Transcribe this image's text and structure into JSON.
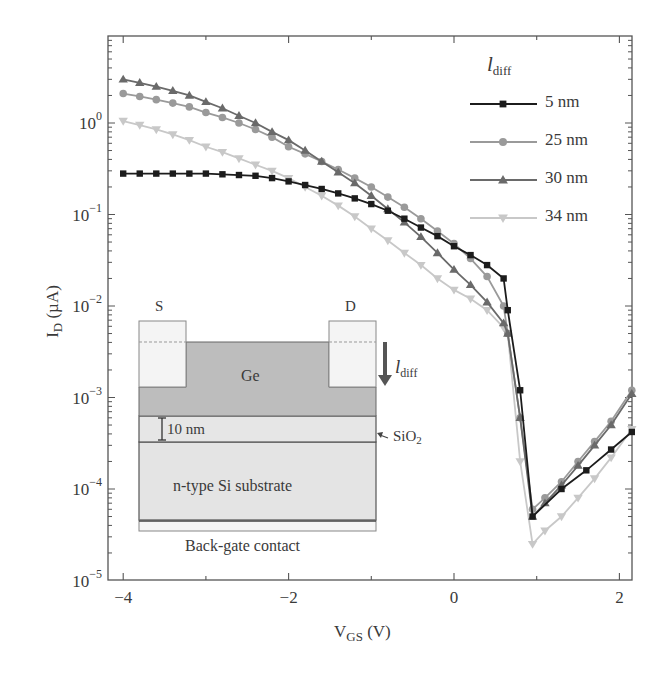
{
  "chart_data": {
    "type": "line",
    "title": "",
    "xlabel": "V_GS (V)",
    "ylabel": "I_D (µA)",
    "xlabel_main": "V",
    "xlabel_sub": "GS",
    "xlabel_unit": "(V)",
    "ylabel_main": "I",
    "ylabel_sub": "D",
    "ylabel_unit": "(µA)",
    "xlim": [
      -4.18,
      2.18
    ],
    "ylim": [
      1e-05,
      9
    ],
    "yscale": "log",
    "x_ticks": [
      -4,
      -2,
      0,
      2
    ],
    "x_tick_labels": [
      "−4",
      "−2",
      "0",
      "2"
    ],
    "y_ticks": [
      1,
      0.1,
      0.01,
      0.001,
      0.0001,
      1e-05
    ],
    "y_tick_labels": [
      {
        "base": "10",
        "exp": "0"
      },
      {
        "base": "10",
        "exp": "−1"
      },
      {
        "base": "10",
        "exp": "−2"
      },
      {
        "base": "10",
        "exp": "−3"
      },
      {
        "base": "10",
        "exp": "−4"
      },
      {
        "base": "10",
        "exp": "−5"
      }
    ],
    "grid": false,
    "legend": {
      "title": "l",
      "title_sub": "diff",
      "position": "upper right",
      "entries": [
        "5 nm",
        "25 nm",
        "30 nm",
        "34 nm"
      ]
    },
    "series": [
      {
        "name": "5 nm",
        "color": "#1c1c1c",
        "marker": "square",
        "x": [
          -4.0,
          -3.8,
          -3.6,
          -3.4,
          -3.2,
          -3.0,
          -2.8,
          -2.6,
          -2.4,
          -2.2,
          -2.0,
          -1.8,
          -1.6,
          -1.4,
          -1.2,
          -1.0,
          -0.8,
          -0.6,
          -0.4,
          -0.2,
          0.0,
          0.2,
          0.4,
          0.6,
          0.65,
          0.8,
          0.95,
          1.3,
          1.6,
          1.9,
          2.15
        ],
        "y": [
          0.28,
          0.28,
          0.28,
          0.28,
          0.28,
          0.28,
          0.275,
          0.27,
          0.265,
          0.25,
          0.23,
          0.21,
          0.19,
          0.17,
          0.15,
          0.13,
          0.11,
          0.09,
          0.072,
          0.058,
          0.045,
          0.036,
          0.028,
          0.02,
          0.009,
          0.0012,
          5e-05,
          0.0001,
          0.00016,
          0.00027,
          0.00042
        ]
      },
      {
        "name": "25 nm",
        "color": "#9a9a9a",
        "marker": "circle",
        "x": [
          -4.0,
          -3.8,
          -3.6,
          -3.4,
          -3.2,
          -3.0,
          -2.8,
          -2.6,
          -2.4,
          -2.2,
          -2.0,
          -1.8,
          -1.6,
          -1.4,
          -1.2,
          -1.0,
          -0.8,
          -0.6,
          -0.4,
          -0.2,
          0.0,
          0.2,
          0.4,
          0.6,
          0.65,
          0.8,
          0.95,
          1.1,
          1.3,
          1.5,
          1.7,
          1.9,
          2.15
        ],
        "y": [
          2.1,
          1.95,
          1.8,
          1.65,
          1.5,
          1.3,
          1.15,
          1.0,
          0.85,
          0.7,
          0.55,
          0.46,
          0.38,
          0.31,
          0.25,
          0.2,
          0.155,
          0.12,
          0.09,
          0.066,
          0.048,
          0.033,
          0.021,
          0.01,
          0.005,
          0.0006,
          6e-05,
          8e-05,
          0.00012,
          0.0002,
          0.00033,
          0.00055,
          0.0012
        ]
      },
      {
        "name": "30 nm",
        "color": "#6a6a6a",
        "marker": "triangle",
        "x": [
          -4.0,
          -3.8,
          -3.6,
          -3.4,
          -3.2,
          -3.0,
          -2.8,
          -2.6,
          -2.4,
          -2.2,
          -2.0,
          -1.8,
          -1.6,
          -1.4,
          -1.2,
          -1.0,
          -0.8,
          -0.6,
          -0.4,
          -0.2,
          0.0,
          0.2,
          0.4,
          0.6,
          0.65,
          0.8,
          0.95,
          1.1,
          1.3,
          1.5,
          1.7,
          1.9,
          2.15
        ],
        "y": [
          3.0,
          2.75,
          2.5,
          2.25,
          2.0,
          1.7,
          1.45,
          1.2,
          1.0,
          0.8,
          0.65,
          0.5,
          0.38,
          0.29,
          0.22,
          0.16,
          0.115,
          0.082,
          0.057,
          0.038,
          0.025,
          0.017,
          0.011,
          0.0065,
          0.005,
          0.0006,
          5e-05,
          7e-05,
          0.00011,
          0.00018,
          0.0003,
          0.0005,
          0.0011
        ]
      },
      {
        "name": "34 nm",
        "color": "#c8c8c8",
        "marker": "triangle-down",
        "x": [
          -4.0,
          -3.8,
          -3.6,
          -3.4,
          -3.2,
          -3.0,
          -2.8,
          -2.6,
          -2.4,
          -2.2,
          -2.0,
          -1.8,
          -1.6,
          -1.4,
          -1.2,
          -1.0,
          -0.8,
          -0.6,
          -0.4,
          -0.2,
          0.0,
          0.2,
          0.4,
          0.6,
          0.65,
          0.8,
          0.95,
          1.1,
          1.3,
          1.5,
          1.7,
          1.9,
          2.15
        ],
        "y": [
          1.05,
          0.95,
          0.85,
          0.75,
          0.65,
          0.55,
          0.48,
          0.41,
          0.35,
          0.3,
          0.25,
          0.2,
          0.16,
          0.125,
          0.095,
          0.07,
          0.052,
          0.038,
          0.028,
          0.02,
          0.015,
          0.012,
          0.009,
          0.0058,
          0.005,
          0.0002,
          2.5e-05,
          3.5e-05,
          5e-05,
          8e-05,
          0.00013,
          0.00022,
          0.00045
        ]
      }
    ]
  },
  "inset": {
    "source_label": "S",
    "drain_label": "D",
    "channel_label": "Ge",
    "oxide_thickness_label": "10 nm",
    "oxide_label": "SiO",
    "oxide_sub": "2",
    "substrate_label": "n-type Si substrate",
    "backgate_label": "Back-gate contact",
    "arrow_label": "l",
    "arrow_label_sub": "diff"
  }
}
